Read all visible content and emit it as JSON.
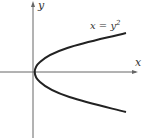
{
  "figure": {
    "axis_x_label": "x",
    "axis_y_label": "y",
    "curve_label_base": "x = y",
    "curve_label_exponent": "2",
    "curve_equation": "x = y^2",
    "colors": {
      "axis": "#666666",
      "curve": "#222222",
      "text": "#333333",
      "background": "#ffffff"
    }
  }
}
